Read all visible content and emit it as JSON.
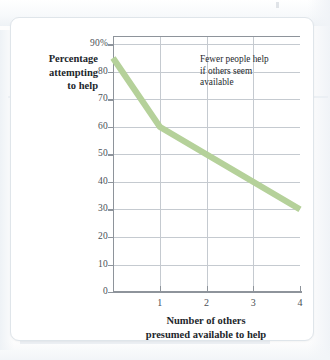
{
  "figure": {
    "kind": "line-graph",
    "annotation": {
      "line1": "Fewer people help",
      "line2": "if others seem",
      "line3": "available"
    },
    "y_axis_title": {
      "line1": "Percentage",
      "line2": "attempting",
      "line3": "to help"
    },
    "x_axis_title": {
      "line1": "Number of others",
      "line2": "presumed available to help"
    }
  },
  "colors": {
    "series_line": "#b5d19a",
    "axis": "#8e949b",
    "gridline": "#c5cad0",
    "text": "#22262b",
    "tick_text": "#4a4f55",
    "card_background": "#ffffff",
    "card_border": "#dfe5ea",
    "page_background": "#fdfdfd"
  },
  "chart_data": {
    "type": "line",
    "title": "",
    "subtitle": "",
    "xlabel": "Number of others presumed available to help",
    "ylabel": "Percentage attempting to help",
    "x": [
      0,
      1,
      2,
      3,
      4
    ],
    "values": [
      85,
      60,
      50,
      40,
      30
    ],
    "series": [
      {
        "name": "Percentage attempting to help",
        "values": [
          85,
          60,
          50,
          40,
          30
        ],
        "color": "#b5d19a"
      }
    ],
    "xlim": [
      0,
      4
    ],
    "ylim": [
      0,
      93
    ],
    "xticks": [
      1,
      2,
      3,
      4
    ],
    "xtick_labels": [
      "1",
      "2",
      "3",
      "4"
    ],
    "yticks": [
      0,
      10,
      20,
      30,
      40,
      50,
      60,
      70,
      80,
      90
    ],
    "ytick_labels": [
      "0",
      "10",
      "20",
      "30",
      "40",
      "50",
      "60",
      "70",
      "80",
      "90%"
    ],
    "grid": "horizontal-and-vertical",
    "legend": "none",
    "annotations": [
      {
        "text": "Fewer people help if others seem available",
        "x": 2.2,
        "y": 88
      }
    ]
  }
}
